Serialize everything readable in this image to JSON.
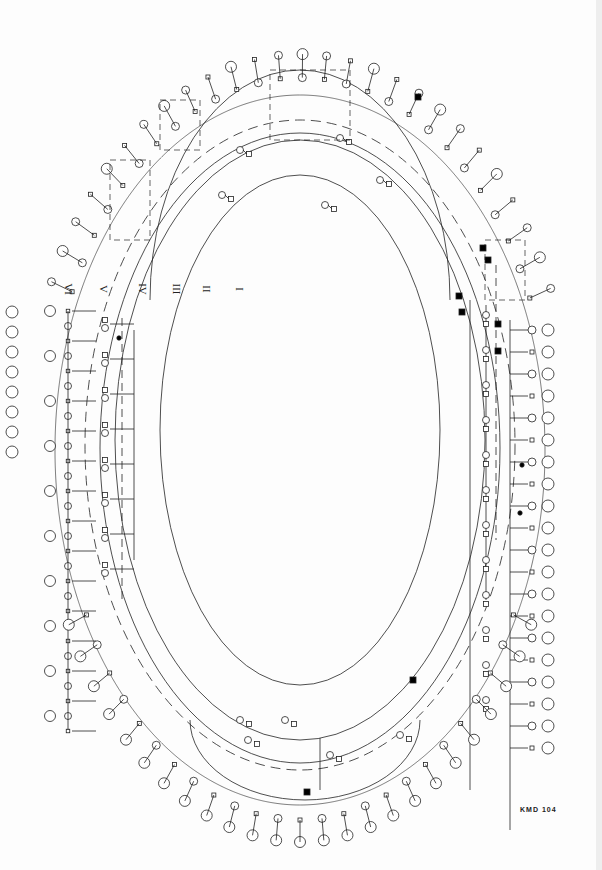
{
  "diagram": {
    "type": "pedigree",
    "layout": "concentric-oval",
    "identifier": "KMD 104",
    "generations": [
      {
        "label": "I",
        "x": 238,
        "y": 283
      },
      {
        "label": "II",
        "x": 203,
        "y": 283
      },
      {
        "label": "III",
        "x": 171,
        "y": 283
      },
      {
        "label": "IV",
        "x": 137,
        "y": 283
      },
      {
        "label": "V",
        "x": 100,
        "y": 283
      },
      {
        "label": "VI",
        "x": 63,
        "y": 283
      }
    ],
    "colors": {
      "line": "#222222",
      "affected": "#000000",
      "paper": "#fdfdfd"
    },
    "legend_symbols": {
      "male": "square",
      "female": "circle",
      "unknown-sex": "diamond",
      "affected": "filled",
      "deceased": "slash"
    },
    "tracks": [
      {
        "name": "generation-II",
        "cx": 300,
        "cy": 430,
        "rx": 140,
        "ry": 255,
        "dashed": false
      },
      {
        "name": "generation-III",
        "cx": 300,
        "cy": 440,
        "rx": 185,
        "ry": 300,
        "dashed": false
      },
      {
        "name": "generation-IV",
        "cx": 300,
        "cy": 445,
        "rx": 215,
        "ry": 325,
        "dashed": true
      },
      {
        "name": "generation-IV-inner",
        "cx": 300,
        "cy": 448,
        "rx": 200,
        "ry": 315,
        "dashed": false
      }
    ],
    "left_column_ids": [
      "142",
      "143",
      "144",
      "145",
      "146",
      "147",
      "148",
      "149",
      "150",
      "151",
      "152",
      "153",
      "154",
      "155",
      "156",
      "157",
      "158",
      "159",
      "160",
      "161",
      "162",
      "163",
      "164",
      "165",
      "166",
      "167",
      "168",
      "169",
      "170"
    ],
    "left_outer_ids": [
      "289",
      "290",
      "291",
      "292",
      "293",
      "294",
      "295",
      "296"
    ],
    "right_column_ids": [
      "101",
      "102",
      "103",
      "104",
      "105",
      "106",
      "107",
      "108",
      "109",
      "110",
      "111",
      "112",
      "113",
      "114",
      "115",
      "116",
      "117",
      "118",
      "119",
      "120"
    ],
    "affected_individuals": [
      {
        "id": "IV-affected-1",
        "x": 418,
        "y": 97
      },
      {
        "id": "III-affected-1",
        "x": 459,
        "y": 296
      },
      {
        "id": "III-affected-2",
        "x": 462,
        "y": 312
      },
      {
        "id": "IV-affected-2",
        "x": 483,
        "y": 248
      },
      {
        "id": "IV-affected-3",
        "x": 488,
        "y": 260
      },
      {
        "id": "IV-affected-4",
        "x": 498,
        "y": 324
      },
      {
        "id": "IV-affected-5",
        "x": 498,
        "y": 351
      },
      {
        "id": "II-affected-1",
        "x": 413,
        "y": 680
      },
      {
        "id": "IV-affected-6",
        "x": 307,
        "y": 792
      },
      {
        "id": "V-affected-1",
        "x": 522,
        "y": 465
      },
      {
        "id": "V-affected-2",
        "x": 520,
        "y": 513
      },
      {
        "id": "V-affected-3",
        "x": 119,
        "y": 338
      }
    ]
  }
}
